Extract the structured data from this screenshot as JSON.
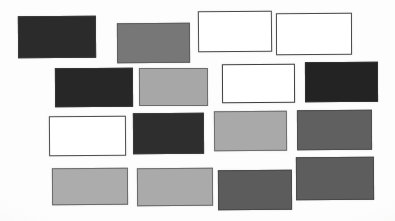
{
  "figure": {
    "background_color": "#fdfdfd",
    "width": 395,
    "height": 221,
    "row_count": 4,
    "patch_count": 16
  },
  "chart_data": {
    "type": "heatmap",
    "subtitle": "",
    "xlabel": "",
    "ylabel": "",
    "grid": false,
    "legend": "none",
    "value_unit": "gray level (0=black, 255=white)",
    "rows": [
      {
        "row_index": 1,
        "row_label": "Row 1",
        "patches": [
          {
            "id": "r1c1",
            "label": "Patch 1",
            "fill": "#2b2b2b",
            "border": "#3a3a3a",
            "gray_level": 43,
            "tone": "near-black",
            "x": 18,
            "y": 16,
            "width": 78,
            "height": 42,
            "border_width": 1,
            "rotation": -0.4
          },
          {
            "id": "r1c2",
            "label": "Patch 2",
            "fill": "#777777",
            "border": "#5e5e5e",
            "gray_level": 119,
            "tone": "medium-gray",
            "x": 117,
            "y": 23,
            "width": 73,
            "height": 40,
            "border_width": 1.5,
            "rotation": -0.3
          },
          {
            "id": "r1c3",
            "label": "Patch 3",
            "fill": "#ffffff",
            "border": "#4a4a4a",
            "gray_level": 255,
            "tone": "white",
            "x": 198,
            "y": 11,
            "width": 74,
            "height": 41,
            "border_width": 1.5,
            "rotation": -0.5
          },
          {
            "id": "r1c4",
            "label": "Patch 4",
            "fill": "#ffffff",
            "border": "#4a4a4a",
            "gray_level": 255,
            "tone": "white",
            "x": 276,
            "y": 13,
            "width": 76,
            "height": 42,
            "border_width": 1.5,
            "rotation": -0.2
          }
        ]
      },
      {
        "row_index": 2,
        "row_label": "Row 2",
        "patches": [
          {
            "id": "r2c1",
            "label": "Patch 5",
            "fill": "#272727",
            "border": "#343434",
            "gray_level": 39,
            "tone": "near-black",
            "x": 55,
            "y": 68,
            "width": 78,
            "height": 39,
            "border_width": 1,
            "rotation": -0.3
          },
          {
            "id": "r2c2",
            "label": "Patch 6",
            "fill": "#a7a7a7",
            "border": "#6d6d6d",
            "gray_level": 167,
            "tone": "light-gray",
            "x": 139,
            "y": 68,
            "width": 69,
            "height": 38,
            "border_width": 1.5,
            "rotation": -0.2
          },
          {
            "id": "r2c3",
            "label": "Patch 7",
            "fill": "#ffffff",
            "border": "#3f3f3f",
            "gray_level": 255,
            "tone": "white",
            "x": 222,
            "y": 64,
            "width": 73,
            "height": 39,
            "border_width": 1.5,
            "rotation": -0.3
          },
          {
            "id": "r2c4",
            "label": "Patch 8",
            "fill": "#232323",
            "border": "#303030",
            "gray_level": 35,
            "tone": "near-black",
            "x": 305,
            "y": 62,
            "width": 73,
            "height": 40,
            "border_width": 1,
            "rotation": -0.2
          }
        ]
      },
      {
        "row_index": 3,
        "row_label": "Row 3",
        "patches": [
          {
            "id": "r3c1",
            "label": "Patch 9",
            "fill": "#ffffff",
            "border": "#4d4d4d",
            "gray_level": 255,
            "tone": "white",
            "x": 49,
            "y": 116,
            "width": 77,
            "height": 40,
            "border_width": 1.5,
            "rotation": -0.4
          },
          {
            "id": "r3c2",
            "label": "Patch 10",
            "fill": "#2e2e2e",
            "border": "#3b3b3b",
            "gray_level": 46,
            "tone": "near-black",
            "x": 133,
            "y": 113,
            "width": 71,
            "height": 41,
            "border_width": 1,
            "rotation": -0.3
          },
          {
            "id": "r3c3",
            "label": "Patch 11",
            "fill": "#a9a9a9",
            "border": "#6f6f6f",
            "gray_level": 169,
            "tone": "light-gray",
            "x": 214,
            "y": 111,
            "width": 73,
            "height": 40,
            "border_width": 1.5,
            "rotation": -0.3
          },
          {
            "id": "r3c4",
            "label": "Patch 12",
            "fill": "#606060",
            "border": "#4e4e4e",
            "gray_level": 96,
            "tone": "dark-gray",
            "x": 297,
            "y": 110,
            "width": 75,
            "height": 40,
            "border_width": 1.5,
            "rotation": -0.2
          }
        ]
      },
      {
        "row_index": 4,
        "row_label": "Row 4",
        "patches": [
          {
            "id": "r4c1",
            "label": "Patch 13",
            "fill": "#acacac",
            "border": "#6b6b6b",
            "gray_level": 172,
            "tone": "light-gray",
            "x": 52,
            "y": 168,
            "width": 76,
            "height": 37,
            "border_width": 1.5,
            "rotation": -0.3
          },
          {
            "id": "r4c2",
            "label": "Patch 14",
            "fill": "#aaaaaa",
            "border": "#6b6b6b",
            "gray_level": 170,
            "tone": "light-gray",
            "x": 137,
            "y": 168,
            "width": 76,
            "height": 38,
            "border_width": 1.5,
            "rotation": -0.3
          },
          {
            "id": "r4c3",
            "label": "Patch 15",
            "fill": "#5c5c5c",
            "border": "#4a4a4a",
            "gray_level": 92,
            "tone": "dark-gray",
            "x": 218,
            "y": 170,
            "width": 74,
            "height": 40,
            "border_width": 1.5,
            "rotation": -0.3
          },
          {
            "id": "r4c4",
            "label": "Patch 16",
            "fill": "#5d5d5d",
            "border": "#4a4a4a",
            "gray_level": 93,
            "tone": "dark-gray",
            "x": 296,
            "y": 157,
            "width": 78,
            "height": 43,
            "border_width": 1.5,
            "rotation": -0.3
          }
        ]
      }
    ]
  }
}
